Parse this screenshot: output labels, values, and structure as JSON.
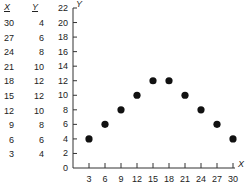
{
  "table": {
    "headers": [
      "X",
      "Y"
    ],
    "rows": [
      {
        "x": "30",
        "y": "4"
      },
      {
        "x": "27",
        "y": "6"
      },
      {
        "x": "24",
        "y": "8"
      },
      {
        "x": "21",
        "y": "10"
      },
      {
        "x": "18",
        "y": "12"
      },
      {
        "x": "15",
        "y": "12"
      },
      {
        "x": "12",
        "y": "10"
      },
      {
        "x": "9",
        "y": "8"
      },
      {
        "x": "6",
        "y": "6"
      },
      {
        "x": "3",
        "y": "4"
      }
    ]
  },
  "chart_data": {
    "type": "scatter",
    "title": "",
    "xlabel": "X",
    "ylabel": "Y",
    "x": [
      3,
      6,
      9,
      12,
      15,
      18,
      21,
      24,
      27,
      30
    ],
    "y": [
      4,
      6,
      8,
      10,
      12,
      12,
      10,
      8,
      6,
      4
    ],
    "xticks": [
      "3",
      "6",
      "9",
      "12",
      "15",
      "18",
      "21",
      "24",
      "27",
      "30"
    ],
    "yticks": [
      "0",
      "2",
      "4",
      "6",
      "8",
      "10",
      "12",
      "14",
      "16",
      "18",
      "20",
      "22"
    ],
    "xlim": [
      0,
      30
    ],
    "ylim": [
      0,
      22
    ],
    "grid": false,
    "legend": null,
    "marker_color": "#111111"
  }
}
